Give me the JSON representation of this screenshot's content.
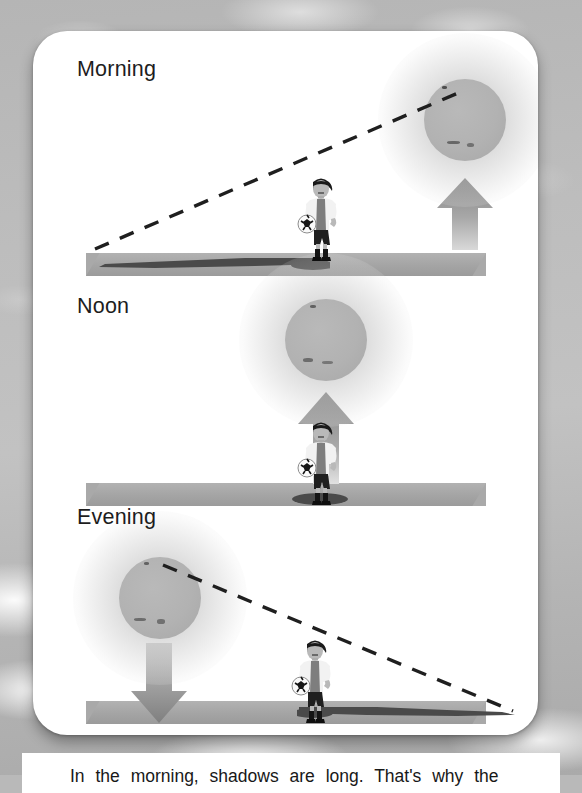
{
  "page": {
    "background_color": "#b9b9b9",
    "card_color": "#ffffff"
  },
  "diagram": {
    "title_visible": false,
    "scenes": [
      {
        "id": "morning",
        "label": "Morning",
        "sun_position": "upper-right, low on horizon",
        "arrow_direction": "up",
        "shadow_direction": "left",
        "shadow_length": "long",
        "ray_direction": "from lower-left to upper-right"
      },
      {
        "id": "noon",
        "label": "Noon",
        "sun_position": "directly overhead",
        "arrow_direction": "up",
        "shadow_direction": "beneath",
        "shadow_length": "short",
        "ray_direction": "none"
      },
      {
        "id": "evening",
        "label": "Evening",
        "sun_position": "left, low on horizon",
        "arrow_direction": "down",
        "shadow_direction": "right",
        "shadow_length": "long",
        "ray_direction": "from upper-left to lower-right"
      }
    ],
    "colors": {
      "sun": "#b2b2b2",
      "ground": "#a9a9a9",
      "shadow": "#4a4a4a",
      "arrow": "#8e8e8e",
      "ray_dash": "#1f1f1f",
      "label_text": "#1d1d1d"
    }
  },
  "caption": {
    "text": "In the morning, shadows are long. That's why the"
  }
}
